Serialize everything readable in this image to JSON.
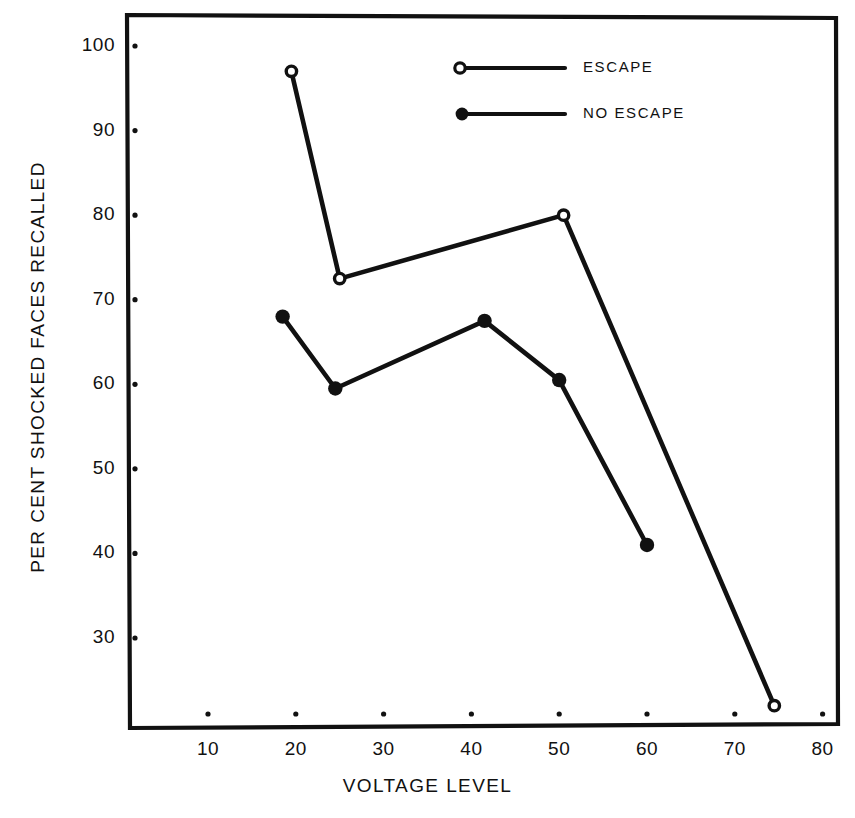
{
  "chart_data": {
    "type": "line",
    "title": "",
    "xlabel": "VOLTAGE LEVEL",
    "ylabel": "PER CENT SHOCKED FACES RECALLED",
    "xlim": [
      5,
      82
    ],
    "ylim": [
      21,
      103
    ],
    "grid": false,
    "legend_position": "top-right",
    "xticks": [
      10,
      20,
      30,
      40,
      50,
      60,
      70,
      80
    ],
    "xtick_labels": [
      "10",
      "20",
      "30",
      "40",
      "50",
      "60",
      "70",
      "80"
    ],
    "yticks": [
      30,
      40,
      50,
      60,
      70,
      80,
      90,
      100
    ],
    "ytick_labels": [
      "30",
      "40",
      "50",
      "60",
      "70",
      "80",
      "90",
      "100"
    ],
    "series": [
      {
        "name": "ESCAPE",
        "marker": "open-circle",
        "x": [
          19.5,
          25.0,
          50.5,
          74.5
        ],
        "values": [
          97.0,
          72.5,
          80.0,
          22.0
        ]
      },
      {
        "name": "NO ESCAPE",
        "marker": "filled-circle",
        "x": [
          18.5,
          24.5,
          41.5,
          50.0,
          60.0
        ],
        "values": [
          68.0,
          59.5,
          67.5,
          60.5,
          41.0
        ]
      }
    ]
  },
  "legend": {
    "items": [
      {
        "label": "ESCAPE",
        "marker": "open-circle"
      },
      {
        "label": "NO ESCAPE",
        "marker": "filled-circle"
      }
    ]
  },
  "colors": {
    "ink": "#111111",
    "background": "#ffffff"
  }
}
